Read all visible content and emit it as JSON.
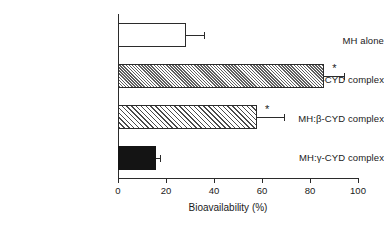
{
  "chart_data": {
    "type": "bar",
    "orientation": "horizontal",
    "title": "",
    "xlabel": "Bioavailability (%)",
    "ylabel": "",
    "xlim": [
      0,
      100
    ],
    "xticks": [
      0,
      20,
      40,
      60,
      80,
      100
    ],
    "xtick_labels": [
      "0",
      "20",
      "40",
      "60",
      "80",
      "100"
    ],
    "grid": false,
    "legend": null,
    "categories": [
      "MH alone",
      "MH:α-CYD complex",
      "MH:β-CYD complex",
      "MH:γ-CYD complex"
    ],
    "values": [
      28.5,
      86.0,
      58.0,
      16.0
    ],
    "errors_upper": [
      7.5,
      8.0,
      11.0,
      1.5
    ],
    "error_upper_values": [
      36.0,
      94.0,
      69.0,
      17.5
    ],
    "significance_marks": [
      "",
      "*",
      "*",
      ""
    ],
    "bar_fills": [
      "white",
      "hatch-dense",
      "hatch-coarse",
      "black"
    ],
    "annotation_symbol": "*"
  },
  "bars": [
    {
      "label": "MH alone",
      "value": 28.5,
      "error_top": 36.0,
      "fill": "fill-white",
      "star": ""
    },
    {
      "label": "MH:α-CYD complex",
      "value": 86.0,
      "error_top": 94.0,
      "fill": "fill-hatch-dense",
      "star": "*"
    },
    {
      "label": "MH:β-CYD complex",
      "value": 58.0,
      "error_top": 69.0,
      "fill": "fill-hatch-coarse",
      "star": "*"
    },
    {
      "label": "MH:γ-CYD complex",
      "value": 16.0,
      "error_top": 17.5,
      "fill": "fill-black",
      "star": ""
    }
  ],
  "axis": {
    "x_title": "Bioavailability (%)",
    "ticks": [
      "0",
      "20",
      "40",
      "60",
      "80",
      "100"
    ]
  }
}
